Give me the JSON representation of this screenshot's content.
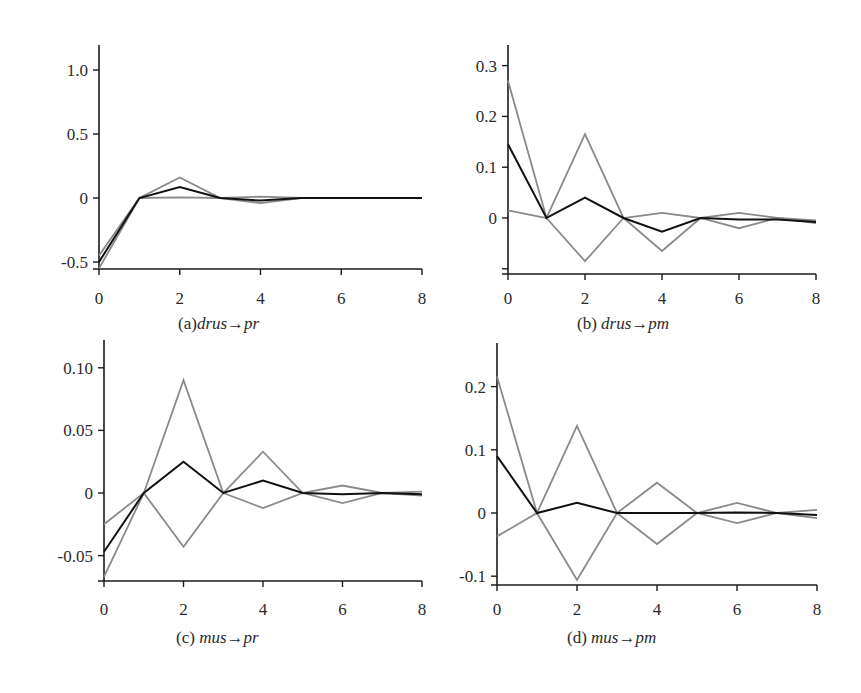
{
  "figure": {
    "background": "#ffffff",
    "axis_color": "#1a1a1a",
    "black_series_color": "#111111",
    "gray_series_color": "#8a8a8a"
  },
  "chart_data": [
    {
      "id": "a",
      "type": "line",
      "caption": {
        "prefix": "(a)",
        "text": "drus→pr"
      },
      "xlabel": "",
      "ylabel": "",
      "x": [
        0,
        1,
        2,
        3,
        4,
        5,
        6,
        7,
        8
      ],
      "xticks": [
        0,
        2,
        4,
        6,
        8
      ],
      "xtick_labels": [
        "0",
        "2",
        "4",
        "6",
        "8"
      ],
      "yticks": [
        -0.5,
        0,
        0.5,
        1.0
      ],
      "ytick_labels": [
        "-0.5",
        "0",
        "0.5",
        "1.0"
      ],
      "xlim": [
        0,
        8
      ],
      "ylim": [
        -0.56,
        1.2
      ],
      "grid": false,
      "legend": null,
      "series": [
        {
          "name": "upper bound",
          "style": "gray",
          "values": [
            -0.45,
            0,
            0.16,
            0,
            0.01,
            0,
            0,
            0,
            0
          ]
        },
        {
          "name": "estimate",
          "style": "black",
          "values": [
            -0.5,
            0,
            0.085,
            0,
            -0.02,
            0,
            0,
            0,
            0
          ]
        },
        {
          "name": "lower bound",
          "style": "gray",
          "values": [
            -0.55,
            0,
            0.005,
            0,
            -0.04,
            0,
            0,
            0,
            0
          ]
        }
      ],
      "layout": {
        "x0": 99,
        "x8": 422,
        "y_zero": 198,
        "px_per_unit": 128,
        "axis_top": 45,
        "axis_bottom": 269,
        "tick_label_y": 304,
        "caption_x": 178,
        "caption_y": 314
      }
    },
    {
      "id": "b",
      "type": "line",
      "caption": {
        "prefix": "(b) ",
        "text": "drus→pm"
      },
      "xlabel": "",
      "ylabel": "",
      "x": [
        0,
        1,
        2,
        3,
        4,
        5,
        6,
        7,
        8
      ],
      "xticks": [
        0,
        2,
        4,
        6,
        8
      ],
      "xtick_labels": [
        "0",
        "2",
        "4",
        "6",
        "8"
      ],
      "yticks": [
        -0.1,
        0,
        0.1,
        0.2,
        0.3
      ],
      "ytick_labels": [
        "",
        "0",
        "0.1",
        "0.2",
        "0.3"
      ],
      "xlim": [
        0,
        8
      ],
      "ylim": [
        -0.11,
        0.34
      ],
      "grid": false,
      "legend": null,
      "series": [
        {
          "name": "upper bound",
          "style": "gray",
          "values": [
            0.27,
            0,
            0.165,
            0,
            -0.065,
            0,
            -0.02,
            0,
            -0.005
          ]
        },
        {
          "name": "estimate",
          "style": "black",
          "values": [
            0.145,
            0,
            0.04,
            0,
            -0.027,
            0,
            -0.003,
            -0.003,
            -0.008
          ]
        },
        {
          "name": "lower bound",
          "style": "gray",
          "values": [
            0.015,
            0,
            -0.085,
            0,
            0.01,
            0,
            0.01,
            0,
            -0.01
          ]
        }
      ],
      "layout": {
        "x0": 508,
        "x8": 816,
        "y_zero": 218,
        "px_per_unit": 508,
        "axis_top": 45,
        "axis_bottom": 274,
        "tick_label_y": 304,
        "caption_x": 577,
        "caption_y": 314
      }
    },
    {
      "id": "c",
      "type": "line",
      "caption": {
        "prefix": "(c) ",
        "text": "mus→pr"
      },
      "xlabel": "",
      "ylabel": "",
      "x": [
        0,
        1,
        2,
        3,
        4,
        5,
        6,
        7,
        8
      ],
      "xticks": [
        0,
        2,
        4,
        6,
        8
      ],
      "xtick_labels": [
        "0",
        "2",
        "4",
        "6",
        "8"
      ],
      "yticks": [
        -0.05,
        0,
        0.05,
        0.1
      ],
      "ytick_labels": [
        "-0.05",
        "0",
        "0.05",
        "0.10"
      ],
      "xlim": [
        0,
        8
      ],
      "ylim": [
        -0.07,
        0.12
      ],
      "grid": false,
      "legend": null,
      "series": [
        {
          "name": "upper bound",
          "style": "gray",
          "values": [
            -0.025,
            0,
            0.09,
            0,
            0.033,
            0,
            0.006,
            0,
            0.001
          ]
        },
        {
          "name": "estimate",
          "style": "black",
          "values": [
            -0.047,
            0,
            0.025,
            0,
            0.01,
            0,
            -0.001,
            0,
            -0.001
          ]
        },
        {
          "name": "lower bound",
          "style": "gray",
          "values": [
            -0.067,
            0,
            -0.043,
            0,
            -0.012,
            0,
            -0.008,
            0,
            -0.002
          ]
        }
      ],
      "layout": {
        "x0": 104,
        "x8": 422,
        "y_zero": 493,
        "px_per_unit": 1252,
        "axis_top": 340,
        "axis_bottom": 581,
        "tick_label_y": 615,
        "caption_x": 176,
        "caption_y": 628
      }
    },
    {
      "id": "d",
      "type": "line",
      "caption": {
        "prefix": "(d) ",
        "text": "mus→pm"
      },
      "xlabel": "",
      "ylabel": "",
      "x": [
        0,
        1,
        2,
        3,
        4,
        5,
        6,
        7,
        8
      ],
      "xticks": [
        0,
        2,
        4,
        6,
        8
      ],
      "xtick_labels": [
        "0",
        "2",
        "4",
        "6",
        "8"
      ],
      "yticks": [
        -0.1,
        0,
        0.1,
        0.2
      ],
      "ytick_labels": [
        "-0.1",
        "0",
        "0.1",
        "0.2"
      ],
      "xlim": [
        0,
        8
      ],
      "ylim": [
        -0.11,
        0.27
      ],
      "grid": false,
      "legend": null,
      "series": [
        {
          "name": "upper bound",
          "style": "gray",
          "values": [
            0.216,
            0,
            0.138,
            0,
            0.048,
            0,
            0.016,
            0,
            0.005
          ]
        },
        {
          "name": "estimate",
          "style": "black",
          "values": [
            0.09,
            0,
            0.016,
            0,
            0,
            0,
            0.001,
            0,
            -0.003
          ]
        },
        {
          "name": "lower bound",
          "style": "gray",
          "values": [
            -0.037,
            0,
            -0.106,
            0,
            -0.049,
            0,
            -0.016,
            0,
            -0.008
          ]
        }
      ],
      "layout": {
        "x0": 497,
        "x8": 817,
        "y_zero": 513,
        "px_per_unit": 632,
        "axis_top": 343,
        "axis_bottom": 585,
        "tick_label_y": 615,
        "caption_x": 567,
        "caption_y": 628
      }
    }
  ]
}
